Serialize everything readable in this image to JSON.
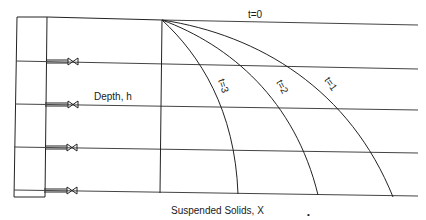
{
  "diagram": {
    "depth_label": "Depth,  h",
    "x_axis_label": "Suspended Solids,  X",
    "x_axis_subscript": "•",
    "curves": [
      {
        "id": "t0",
        "label": "t=0"
      },
      {
        "id": "t1",
        "label": "t=1"
      },
      {
        "id": "t2",
        "label": "t=2"
      },
      {
        "id": "t3",
        "label": "t=3"
      }
    ],
    "sampling_ports": [
      {
        "id": "port-1",
        "icon": "valve-icon"
      },
      {
        "id": "port-2",
        "icon": "valve-icon"
      },
      {
        "id": "port-3",
        "icon": "valve-icon"
      },
      {
        "id": "port-4",
        "icon": "valve-icon"
      }
    ],
    "colors": {
      "line": "#222222",
      "background": "#ffffff"
    }
  }
}
